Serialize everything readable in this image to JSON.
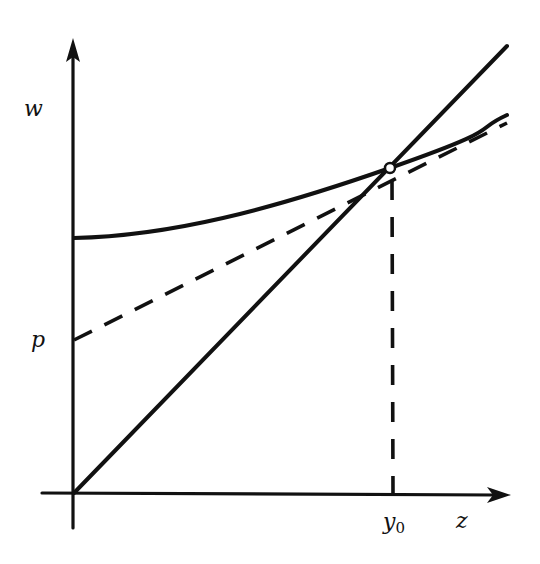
{
  "figure": {
    "axes": {
      "x_label": "z",
      "y_label": "w"
    },
    "labels": {
      "intercept": "p",
      "tangent_point_x": "y",
      "tangent_point_x_sub": "0"
    },
    "elements": [
      {
        "name": "diagonal-line",
        "style": "solid",
        "description": "straight line through origin"
      },
      {
        "name": "convex-curve",
        "style": "solid",
        "description": "curve starting above p on w-axis, tangent to diagonal at y0"
      },
      {
        "name": "tangent-line",
        "style": "dashed",
        "description": "tangent to curve at y0, intercept p on w-axis"
      },
      {
        "name": "y0-drop-line",
        "style": "dashed",
        "description": "vertical line from tangent point down to z-axis at y0"
      }
    ],
    "colors": {
      "ink": "#111111",
      "background": "#ffffff"
    }
  }
}
